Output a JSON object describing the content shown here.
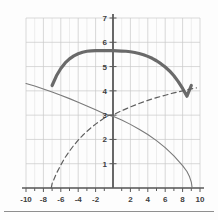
{
  "figure": {
    "background_color": "#fdfdfd",
    "grid_color": "#dcdcdc",
    "grid_major_color": "#c8c8c8",
    "axis_color": "#5a5a5a",
    "label_color": "#3d3d3d",
    "divider_color": "#8e8e8e"
  },
  "chart_data": {
    "type": "line",
    "title": "",
    "subtitle": "",
    "xlabel": "",
    "ylabel": "",
    "xlim": [
      -10,
      10
    ],
    "ylim": [
      0,
      7
    ],
    "grid": true,
    "legend": "none",
    "x_ticks": [
      -10,
      -8,
      -6,
      -4,
      -2,
      2,
      4,
      6,
      8,
      10
    ],
    "x_tick_labels": [
      "-10",
      "-8",
      "-6",
      "-4",
      "-2",
      "2",
      "4",
      "6",
      "8",
      "10"
    ],
    "y_ticks": [
      1,
      2,
      3,
      4,
      5,
      6,
      7
    ],
    "y_tick_labels": [
      "1",
      "2",
      "3",
      "4",
      "5",
      "6",
      "7"
    ],
    "x_minor_step": 1,
    "y_minor_step": 1,
    "series": [
      {
        "name": "thick-arc",
        "style": "solid-thick",
        "color": "#6a6a6a",
        "width": 3.2,
        "x": [
          -7.0,
          -6.5,
          -6.0,
          -5.5,
          -5.0,
          -4.5,
          -4.0,
          -3.5,
          -3.0,
          -2.5,
          -2.0,
          -1.5,
          -1.0,
          -0.5,
          0.0,
          0.5,
          1.0,
          1.5,
          2.0,
          2.5,
          3.0,
          3.5,
          4.0,
          4.5,
          5.0,
          5.5,
          6.0,
          6.5,
          7.0,
          7.5,
          8.0,
          8.5,
          9.0
        ],
        "y": [
          4.22,
          4.62,
          4.92,
          5.15,
          5.32,
          5.44,
          5.53,
          5.59,
          5.63,
          5.65,
          5.66,
          5.66,
          5.66,
          5.66,
          5.66,
          5.65,
          5.64,
          5.63,
          5.61,
          5.58,
          5.54,
          5.49,
          5.42,
          5.34,
          5.24,
          5.12,
          4.98,
          4.82,
          4.62,
          4.38,
          4.1,
          3.78,
          4.22
        ]
      },
      {
        "name": "solid-descending",
        "style": "solid",
        "color": "#7a7a7a",
        "width": 1.1,
        "x": [
          -10.0,
          -9.0,
          -8.0,
          -7.0,
          -6.0,
          -5.0,
          -4.0,
          -3.0,
          -2.0,
          -1.0,
          0.0,
          1.0,
          2.0,
          3.0,
          4.0,
          5.0,
          6.0,
          7.0,
          8.0,
          8.5,
          8.8,
          9.0,
          9.1
        ],
        "y": [
          4.3,
          4.2,
          4.08,
          3.95,
          3.82,
          3.68,
          3.53,
          3.38,
          3.22,
          3.06,
          2.95,
          2.8,
          2.62,
          2.42,
          2.2,
          1.95,
          1.66,
          1.32,
          0.92,
          0.68,
          0.46,
          0.24,
          0.0
        ]
      },
      {
        "name": "dashed-ascending",
        "style": "dashed",
        "color": "#5f5f5f",
        "width": 1.2,
        "x": [
          -7.1,
          -7.0,
          -6.5,
          -6.0,
          -5.5,
          -5.0,
          -4.5,
          -4.0,
          -3.5,
          -3.0,
          -2.5,
          -2.0,
          -1.5,
          -1.0,
          -0.5,
          0.0,
          0.5,
          1.0,
          2.0,
          3.0,
          4.0,
          5.0,
          6.0,
          7.0,
          8.0,
          9.0,
          9.6
        ],
        "y": [
          0.0,
          0.18,
          0.6,
          0.95,
          1.26,
          1.52,
          1.76,
          1.97,
          2.16,
          2.33,
          2.49,
          2.63,
          2.76,
          2.88,
          2.99,
          3.0,
          3.1,
          3.18,
          3.34,
          3.48,
          3.61,
          3.72,
          3.82,
          3.92,
          4.0,
          4.08,
          4.12
        ]
      }
    ]
  }
}
